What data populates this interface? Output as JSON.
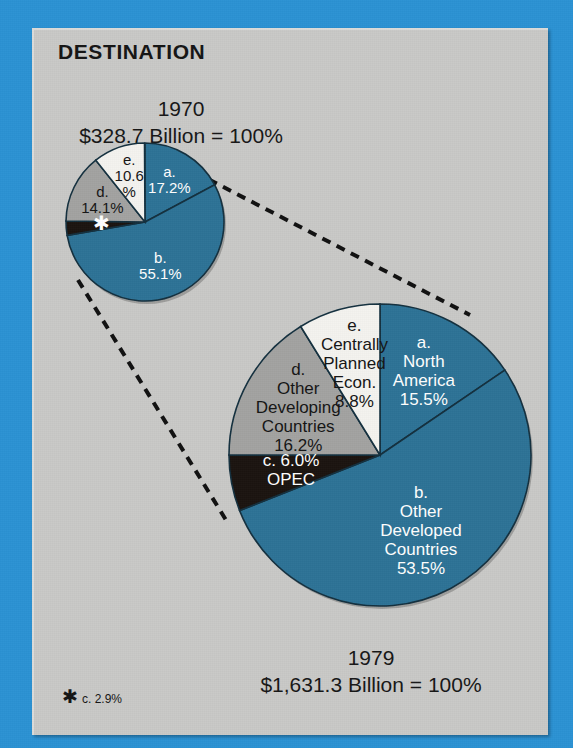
{
  "panel": {
    "title": "DESTINATION",
    "background_color": "#c9c9c7",
    "border_color": "#2b92d4"
  },
  "colors": {
    "blue": "#2d7396",
    "gray": "#a3a3a1",
    "white": "#f4f3ef",
    "black": "#1b1410",
    "outline": "#14303f",
    "page_blue": "#2b92d4",
    "panel_gray": "#c9c9c7",
    "text_dark": "#151515",
    "text_light": "#ffffff"
  },
  "footnote": {
    "marker": "✱",
    "text": "c. 2.9%"
  },
  "chart_data": [
    {
      "type": "pie",
      "name": "1970",
      "title": "1970",
      "subtitle": "$328.7 Billion = 100%",
      "total_value": 328.7,
      "units": "Billion USD",
      "total_percent": "100%",
      "start_angle_deg": 0,
      "direction": "clockwise",
      "categories": [
        "a.",
        "b.",
        "c.",
        "d.",
        "e."
      ],
      "values": [
        17.2,
        55.1,
        2.9,
        14.1,
        10.6
      ],
      "slices": [
        {
          "key": "a",
          "label": "a.",
          "percent": 17.2,
          "percent_text": "17.2%",
          "color": "blue",
          "text_color": "#ffffff",
          "lines": [
            "a.",
            "17.2%"
          ]
        },
        {
          "key": "b",
          "label": "b.",
          "percent": 55.1,
          "percent_text": "55.1%",
          "color": "blue",
          "text_color": "#ffffff",
          "lines": [
            "b.",
            "55.1%"
          ]
        },
        {
          "key": "c",
          "label": "c.",
          "percent": 2.9,
          "percent_text": "2.9%",
          "color": "black",
          "text_color": "#ffffff",
          "lines": [
            "✱"
          ]
        },
        {
          "key": "d",
          "label": "d.",
          "percent": 14.1,
          "percent_text": "14.1%",
          "color": "gray",
          "text_color": "#151515",
          "lines": [
            "d.",
            "14.1%"
          ]
        },
        {
          "key": "e",
          "label": "e.",
          "percent": 10.6,
          "percent_text": "10.6%",
          "color": "white",
          "text_color": "#151515",
          "lines": [
            "e.",
            "10.6",
            "%"
          ]
        }
      ]
    },
    {
      "type": "pie",
      "name": "1979",
      "title": "1979",
      "subtitle": "$1,631.3 Billion = 100%",
      "total_value": 1631.3,
      "units": "Billion USD",
      "total_percent": "100%",
      "start_angle_deg": 0,
      "direction": "clockwise",
      "categories": [
        "a. North America",
        "b. Other Developed Countries",
        "c. OPEC",
        "d. Other Developing Countries",
        "e. Centrally Planned Econ."
      ],
      "values": [
        15.5,
        53.5,
        6.0,
        16.2,
        8.8
      ],
      "slices": [
        {
          "key": "a",
          "label": "a. North America",
          "percent": 15.5,
          "percent_text": "15.5%",
          "color": "blue",
          "text_color": "#ffffff",
          "lines": [
            "a.",
            "North",
            "America",
            "15.5%"
          ]
        },
        {
          "key": "b",
          "label": "b. Other Developed Countries",
          "percent": 53.5,
          "percent_text": "53.5%",
          "color": "blue",
          "text_color": "#ffffff",
          "lines": [
            "b.",
            "Other",
            "Developed",
            "Countries",
            "53.5%"
          ]
        },
        {
          "key": "c",
          "label": "c. OPEC",
          "percent": 6.0,
          "percent_text": "6.0%",
          "color": "black",
          "text_color": "#ffffff",
          "lines": [
            "c.    6.0%",
            "OPEC"
          ]
        },
        {
          "key": "d",
          "label": "d. Other Developing Countries",
          "percent": 16.2,
          "percent_text": "16.2%",
          "color": "gray",
          "text_color": "#151515",
          "lines": [
            "d.",
            "Other",
            "Developing",
            "Countries",
            "16.2%"
          ]
        },
        {
          "key": "e",
          "label": "e. Centrally Planned Econ.",
          "percent": 8.8,
          "percent_text": "8.8%",
          "color": "white",
          "text_color": "#151515",
          "lines": [
            "e.",
            "Centrally",
            "Planned",
            "Econ.",
            "8.8%"
          ]
        }
      ]
    }
  ],
  "connectors": [
    {
      "name": "upper-connector",
      "x1": 152,
      "y1": 150,
      "x2": 470,
      "y2": 315
    },
    {
      "name": "lower-connector",
      "x1": 78,
      "y1": 280,
      "x2": 226,
      "y2": 520
    }
  ]
}
